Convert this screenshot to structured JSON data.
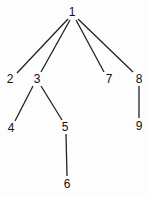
{
  "diagram": {
    "type": "tree",
    "nodes": [
      {
        "id": "1",
        "label": "1",
        "x": 72,
        "y": 12
      },
      {
        "id": "2",
        "label": "2",
        "x": 10,
        "y": 79
      },
      {
        "id": "3",
        "label": "3",
        "x": 37,
        "y": 79
      },
      {
        "id": "7",
        "label": "7",
        "x": 109,
        "y": 79
      },
      {
        "id": "8",
        "label": "8",
        "x": 139,
        "y": 79
      },
      {
        "id": "4",
        "label": "4",
        "x": 11,
        "y": 128
      },
      {
        "id": "5",
        "label": "5",
        "x": 65,
        "y": 127
      },
      {
        "id": "9",
        "label": "9",
        "x": 139,
        "y": 126
      },
      {
        "id": "6",
        "label": "6",
        "x": 67,
        "y": 184
      }
    ],
    "edges": [
      {
        "from": "1",
        "to": "2",
        "x1": 68,
        "y1": 19,
        "x2": 17,
        "y2": 73
      },
      {
        "from": "1",
        "to": "3",
        "x1": 70,
        "y1": 20,
        "x2": 41,
        "y2": 72
      },
      {
        "from": "1",
        "to": "7",
        "x1": 76,
        "y1": 20,
        "x2": 104,
        "y2": 72
      },
      {
        "from": "1",
        "to": "8",
        "x1": 78,
        "y1": 19,
        "x2": 133,
        "y2": 72
      },
      {
        "from": "3",
        "to": "4",
        "x1": 33,
        "y1": 86,
        "x2": 15,
        "y2": 121
      },
      {
        "from": "3",
        "to": "5",
        "x1": 41,
        "y1": 86,
        "x2": 62,
        "y2": 120
      },
      {
        "from": "8",
        "to": "9",
        "x1": 139,
        "y1": 86,
        "x2": 139,
        "y2": 118
      },
      {
        "from": "5",
        "to": "6",
        "x1": 66,
        "y1": 134,
        "x2": 67,
        "y2": 176
      }
    ]
  }
}
